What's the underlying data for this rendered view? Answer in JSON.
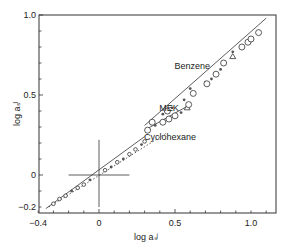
{
  "chart_data": {
    "type": "scatter",
    "title": "",
    "xlabel": "log a_s^J",
    "ylabel": "log a_s^I",
    "xlim": [
      -0.4,
      1.15
    ],
    "ylim": [
      -0.22,
      1.0
    ],
    "grid": false,
    "legend": "none (curves labeled inline)",
    "x_ticks": [
      "-0.4",
      "0",
      "0.5",
      "1.0"
    ],
    "y_ticks": [
      "-0.2",
      "0",
      "0.5",
      "1.0"
    ],
    "annotations": [
      {
        "text": "Benzene",
        "x": 0.72,
        "y": 0.66
      },
      {
        "text": "MEK",
        "x": 0.62,
        "y": 0.4
      },
      {
        "text": "Cyclohexane",
        "x": 0.52,
        "y": 0.22
      }
    ],
    "reference_cross": {
      "x": 0,
      "y": 0,
      "half_width": 0.1,
      "half_height_up": 0.22,
      "half_height_down": 0.2
    },
    "series": [
      {
        "name": "Benzene",
        "line": "solid",
        "line_points": [
          [
            0.3,
            0.31
          ],
          [
            1.1,
            0.98
          ]
        ],
        "points": [
          {
            "x": 0.35,
            "y": 0.33,
            "marker": "open-circle"
          },
          {
            "x": 0.42,
            "y": 0.38,
            "marker": "dot"
          },
          {
            "x": 0.45,
            "y": 0.4,
            "marker": "open-circle"
          },
          {
            "x": 0.48,
            "y": 0.42,
            "marker": "dot"
          },
          {
            "x": 0.56,
            "y": 0.47,
            "marker": "dot"
          },
          {
            "x": 0.62,
            "y": 0.51,
            "marker": "open-circle"
          },
          {
            "x": 0.6,
            "y": 0.54,
            "marker": "dot"
          },
          {
            "x": 0.7,
            "y": 0.58,
            "marker": "dot"
          },
          {
            "x": 0.71,
            "y": 0.57,
            "marker": "open-circle"
          },
          {
            "x": 0.74,
            "y": 0.6,
            "marker": "dot"
          },
          {
            "x": 0.77,
            "y": 0.63,
            "marker": "open-circle"
          },
          {
            "x": 0.8,
            "y": 0.66,
            "marker": "dot"
          },
          {
            "x": 0.82,
            "y": 0.7,
            "marker": "open-circle"
          },
          {
            "x": 0.88,
            "y": 0.74,
            "marker": "triangle"
          },
          {
            "x": 0.88,
            "y": 0.77,
            "marker": "dot"
          },
          {
            "x": 0.94,
            "y": 0.8,
            "marker": "open-circle"
          },
          {
            "x": 0.98,
            "y": 0.83,
            "marker": "open-circle"
          },
          {
            "x": 1.0,
            "y": 0.85,
            "marker": "open-circle"
          },
          {
            "x": 1.05,
            "y": 0.89,
            "marker": "open-circle"
          }
        ]
      },
      {
        "name": "MEK",
        "line": "solid",
        "line_points": [
          [
            0.3,
            0.28
          ],
          [
            0.6,
            0.44
          ]
        ],
        "points": [
          {
            "x": 0.32,
            "y": 0.28,
            "marker": "open-circle"
          },
          {
            "x": 0.37,
            "y": 0.31,
            "marker": "dot"
          },
          {
            "x": 0.42,
            "y": 0.33,
            "marker": "open-circle"
          },
          {
            "x": 0.46,
            "y": 0.35,
            "marker": "open-circle"
          },
          {
            "x": 0.5,
            "y": 0.37,
            "marker": "open-circle"
          },
          {
            "x": 0.54,
            "y": 0.39,
            "marker": "dot"
          },
          {
            "x": 0.58,
            "y": 0.42,
            "marker": "triangle"
          },
          {
            "x": 0.59,
            "y": 0.44,
            "marker": "open-circle"
          }
        ]
      },
      {
        "name": "Cyclohexane",
        "line": "dotted",
        "line_points": [
          [
            -0.33,
            -0.2
          ],
          [
            0.44,
            0.26
          ]
        ],
        "points": [
          {
            "x": -0.3,
            "y": -0.18,
            "marker": "open-circle"
          },
          {
            "x": -0.26,
            "y": -0.15,
            "marker": "open-circle"
          },
          {
            "x": -0.22,
            "y": -0.13,
            "marker": "open-circle"
          },
          {
            "x": -0.18,
            "y": -0.1,
            "marker": "dot"
          },
          {
            "x": -0.14,
            "y": -0.08,
            "marker": "open-circle"
          },
          {
            "x": -0.1,
            "y": -0.06,
            "marker": "open-circle"
          },
          {
            "x": -0.06,
            "y": -0.03,
            "marker": "dot"
          },
          {
            "x": 0.04,
            "y": 0.03,
            "marker": "open-circle"
          },
          {
            "x": 0.08,
            "y": 0.05,
            "marker": "dot"
          },
          {
            "x": 0.12,
            "y": 0.08,
            "marker": "open-circle"
          },
          {
            "x": 0.16,
            "y": 0.1,
            "marker": "dot"
          },
          {
            "x": 0.2,
            "y": 0.13,
            "marker": "open-circle"
          },
          {
            "x": 0.24,
            "y": 0.16,
            "marker": "open-circle"
          },
          {
            "x": 0.28,
            "y": 0.19,
            "marker": "dot"
          },
          {
            "x": 0.3,
            "y": 0.21,
            "marker": "open-circle"
          }
        ]
      }
    ]
  }
}
